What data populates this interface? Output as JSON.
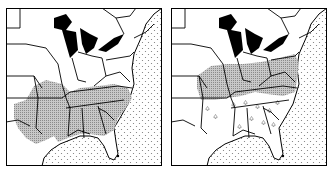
{
  "figure": {
    "panels": [
      {
        "id": "left",
        "description": "Eastern United States map; shaded region covers southern states",
        "shaded_states": [
          "Arkansas",
          "Louisiana",
          "Mississippi",
          "Alabama",
          "Georgia",
          "Tennessee",
          "Kentucky (south)",
          "North Carolina",
          "South Carolina",
          "Missouri (south)",
          "Oklahoma (east)",
          "Texas (east)",
          "Virginia (south)",
          "Florida (panhandle)"
        ],
        "legend": null
      },
      {
        "id": "right",
        "description": "Eastern United States map; shaded region covers Ohio valley and mid-Atlantic, scattered symbols in the south",
        "shaded_states": [
          "Missouri",
          "Illinois",
          "Indiana",
          "Ohio",
          "Pennsylvania",
          "West Virginia",
          "Virginia",
          "Maryland",
          "Kentucky (north)",
          "Iowa (south)"
        ],
        "scattered_symbol_states": [
          "Kentucky",
          "Tennessee",
          "Arkansas",
          "Alabama",
          "Georgia",
          "South Carolina",
          "North Carolina"
        ],
        "legend": null
      }
    ],
    "colors": {
      "land": "#ffffff",
      "border": "#000000",
      "shade": "#b8b8b8",
      "lakes": "#000000",
      "ocean_dots": "#777777"
    }
  }
}
